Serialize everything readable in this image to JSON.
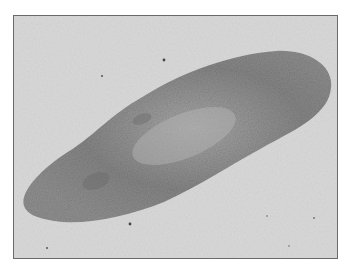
{
  "image": {
    "subject": "planarian flatworm micrograph",
    "style": "grayscale",
    "colors": {
      "background": "#d6d6d6",
      "body": "#8a8a8a",
      "body_dark": "#6e6e6e",
      "body_light": "#b4b4b4",
      "border": "#6a6a6a"
    }
  }
}
